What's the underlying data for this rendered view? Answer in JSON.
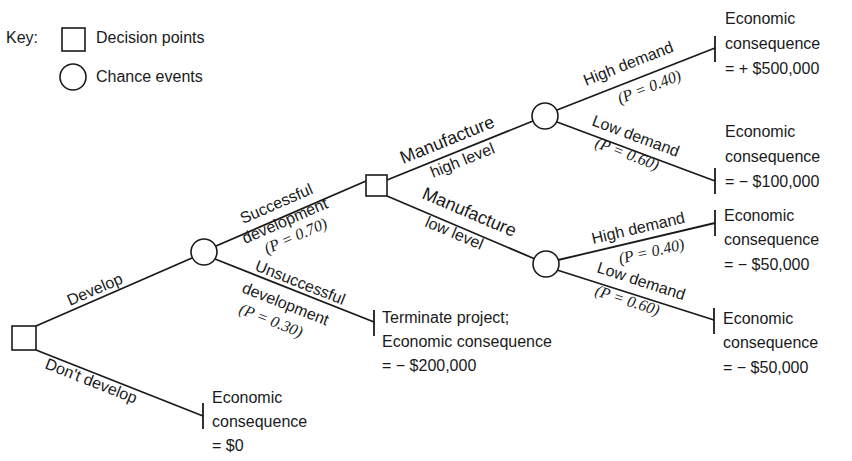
{
  "key": {
    "title": "Key:",
    "decision_label": "Decision points",
    "chance_label": "Chance events"
  },
  "nodes": {
    "root": {
      "type": "decision"
    },
    "development_chance": {
      "type": "chance"
    },
    "manufacture_decision": {
      "type": "decision"
    },
    "high_level_chance": {
      "type": "chance"
    },
    "low_level_chance": {
      "type": "chance"
    }
  },
  "branches": {
    "develop": "Develop",
    "dont_develop": "Don't develop",
    "successful_line1": "Successful",
    "successful_line2": "development",
    "successful_prob": "(P = 0.70)",
    "unsuccessful_line1": "Unsuccessful",
    "unsuccessful_line2": "development",
    "unsuccessful_prob": "(P = 0.30)",
    "mfg_high_line1": "Manufacture",
    "mfg_high_line2": "high level",
    "mfg_low_line1": "Manufacture",
    "mfg_low_line2": "low level",
    "hh_label": "High demand",
    "hh_prob": "(P = 0.40)",
    "hl_label": "Low demand",
    "hl_prob": "(P = 0.60)",
    "lh_label": "High demand",
    "lh_prob": "(P = 0.40)",
    "ll_label": "Low demand",
    "ll_prob": "(P = 0.60)"
  },
  "outcomes": {
    "high_high": {
      "line1": "Economic",
      "line2": "consequence",
      "line3": "= + $500,000"
    },
    "high_low": {
      "line1": "Economic",
      "line2": "consequence",
      "line3": "= − $100,000"
    },
    "low_high": {
      "line1": "Economic",
      "line2": "consequence",
      "line3": "= − $50,000"
    },
    "low_low": {
      "line1": "Economic",
      "line2": "consequence",
      "line3": "= − $50,000"
    },
    "terminate": {
      "line1": "Terminate project;",
      "line2": "Economic consequence",
      "line3": "= − $200,000"
    },
    "dont_develop": {
      "line1": "Economic",
      "line2": "consequence",
      "line3": "= $0"
    }
  }
}
